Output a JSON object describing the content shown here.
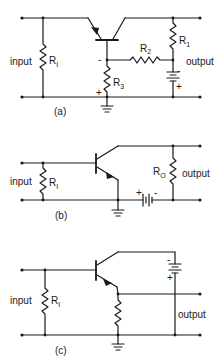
{
  "figure": {
    "panels": [
      {
        "id": "a",
        "caption": "(a)",
        "input_label": "input",
        "output_label": "output",
        "resistors": {
          "input": {
            "name": "R",
            "sub": "I"
          },
          "r1": {
            "name": "R",
            "sub": "1"
          },
          "r2": {
            "name": "R",
            "sub": "2"
          },
          "r3": {
            "name": "R",
            "sub": "3"
          }
        },
        "polarity": {
          "base_node": "-",
          "r3_bottom": "+",
          "battery_top": "-",
          "battery_bottom": "+"
        }
      },
      {
        "id": "b",
        "caption": "(b)",
        "input_label": "input",
        "output_label": "output",
        "resistors": {
          "input": {
            "name": "R",
            "sub": "I"
          },
          "load": {
            "name": "R",
            "sub": "O"
          }
        },
        "polarity": {
          "battery_left": "+",
          "battery_right": "-"
        }
      },
      {
        "id": "c",
        "caption": "(c)",
        "input_label": "input",
        "output_label": "output",
        "resistors": {
          "input": {
            "name": "R",
            "sub": "I"
          }
        },
        "polarity": {
          "battery_top": "-",
          "battery_bottom": "+"
        }
      }
    ]
  }
}
